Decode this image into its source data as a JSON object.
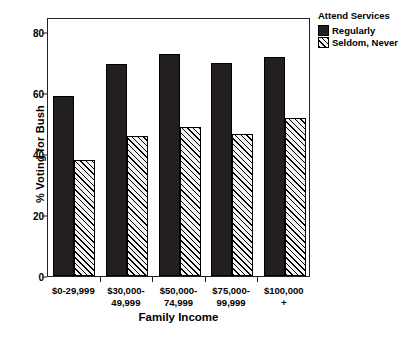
{
  "chart_data": {
    "type": "bar",
    "title": "",
    "xlabel": "Family Income",
    "ylabel": "% Voting for Bush",
    "categories": [
      "$0-29,999",
      "$30,000-\n49,999",
      "$50,000-\n74,999",
      "$75,000-\n99,999",
      "$100,000\n+"
    ],
    "ylim": [
      0,
      85
    ],
    "yticks": [
      0,
      20,
      40,
      60,
      80
    ],
    "ytick_labels": [
      "0",
      "20",
      "40",
      "60",
      "80"
    ],
    "grid": false,
    "legend_position": "outside right top",
    "legend_title": "Attend Services",
    "series": [
      {
        "name": "Regularly",
        "fill": "solid-black",
        "color": "#231f20",
        "values": [
          59,
          69.5,
          73,
          70,
          72
        ]
      },
      {
        "name": "Seldom, Never",
        "fill": "diagonal-hatch",
        "color": "#f2f2f2",
        "values": [
          38,
          46,
          49,
          46.5,
          52
        ]
      }
    ]
  },
  "axes": {
    "y_title": "% Voting for Bush",
    "x_title": "Family Income"
  },
  "legend": {
    "title": "Attend Services",
    "entries": [
      {
        "label": "Regularly"
      },
      {
        "label": "Seldom, Never"
      }
    ]
  }
}
